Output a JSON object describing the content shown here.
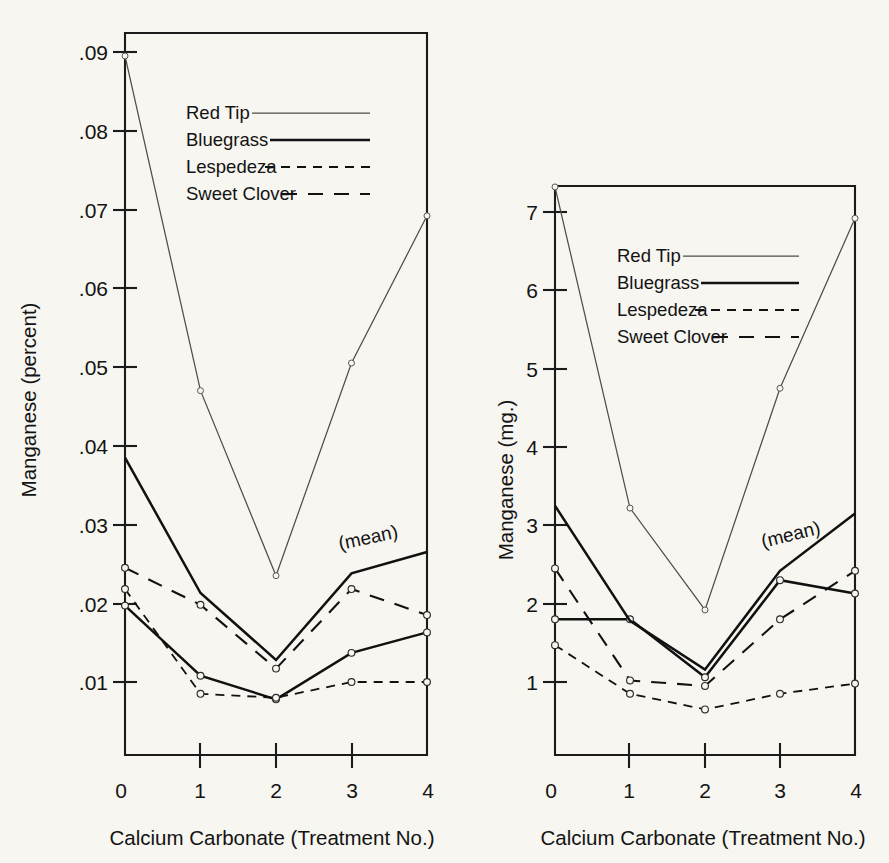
{
  "figure": {
    "background": "#f7f6f1",
    "ink": "#1b1b1b"
  },
  "chart_data": [
    {
      "id": "left",
      "type": "line",
      "title": "",
      "xlabel": "Calcium Carbonate (Treatment No.)",
      "ylabel": "Manganese (percent)",
      "x": [
        0,
        1,
        2,
        3,
        4
      ],
      "xtick_labels": [
        "0",
        "1",
        "2",
        "3",
        "4"
      ],
      "ytick_labels": [
        ".09",
        ".08",
        ".07",
        ".06",
        ".05",
        ".04",
        ".03",
        ".02",
        ".01"
      ],
      "ytick_values": [
        0.09,
        0.08,
        0.07,
        0.06,
        0.05,
        0.04,
        0.03,
        0.02,
        0.01
      ],
      "xlim": [
        0,
        4
      ],
      "ylim": [
        0,
        0.0942
      ],
      "grid": false,
      "annotation": "(mean)",
      "legend_position": "upper-center-inside",
      "series": [
        {
          "name": "Red Tip",
          "style": "thin-solid",
          "values": [
            0.0895,
            0.047,
            0.0235,
            0.0505,
            0.0692
          ]
        },
        {
          "name": "Bluegrass",
          "style": "thick-solid",
          "values": [
            0.0197,
            0.0108,
            0.0078,
            0.0137,
            0.0163
          ]
        },
        {
          "name": "Lespedeza",
          "style": "short-dash",
          "values": [
            0.0218,
            0.0085,
            0.008,
            0.01,
            0.01
          ]
        },
        {
          "name": "Sweet Clover",
          "style": "long-dash",
          "values": [
            0.0245,
            0.0198,
            0.0117,
            0.0218,
            0.0185
          ]
        },
        {
          "name": "(mean)",
          "style": "thick-solid",
          "values": [
            0.0385,
            0.0213,
            0.0128,
            0.0238,
            0.0265
          ]
        }
      ]
    },
    {
      "id": "right",
      "type": "line",
      "title": "",
      "xlabel": "Calcium Carbonate (Treatment No.)",
      "ylabel": "Manganese (mg.)",
      "x": [
        0,
        1,
        2,
        3,
        4
      ],
      "xtick_labels": [
        "0",
        "1",
        "2",
        "3",
        "4"
      ],
      "ytick_labels": [
        "7",
        "6",
        "5",
        "4",
        "3",
        "2",
        "1"
      ],
      "ytick_values": [
        7,
        6,
        5,
        4,
        3,
        2,
        1
      ],
      "xlim": [
        0,
        4
      ],
      "ylim": [
        0,
        7.55
      ],
      "grid": false,
      "annotation": "(mean)",
      "legend_position": "upper-center-inside",
      "series": [
        {
          "name": "Red Tip",
          "style": "thin-solid",
          "values": [
            7.32,
            3.22,
            1.92,
            4.75,
            6.92
          ]
        },
        {
          "name": "Bluegrass",
          "style": "thick-solid",
          "values": [
            1.8,
            1.8,
            1.06,
            2.3,
            2.13
          ]
        },
        {
          "name": "Lespedeza",
          "style": "short-dash",
          "values": [
            1.47,
            0.85,
            0.65,
            0.85,
            0.98
          ]
        },
        {
          "name": "Sweet Clover",
          "style": "long-dash",
          "values": [
            2.45,
            1.02,
            0.95,
            1.8,
            2.42
          ]
        },
        {
          "name": "(mean)",
          "style": "thick-solid",
          "values": [
            3.25,
            1.78,
            1.16,
            2.42,
            3.15
          ]
        }
      ]
    }
  ],
  "legend": {
    "entries": [
      {
        "label": "Red Tip",
        "style": "thin-solid"
      },
      {
        "label": "Bluegrass",
        "style": "thick-solid"
      },
      {
        "label": "Lespedeza",
        "style": "short-dash"
      },
      {
        "label": "Sweet Clover",
        "style": "long-dash"
      }
    ]
  }
}
